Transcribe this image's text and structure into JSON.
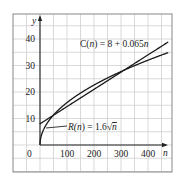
{
  "chart_data": {
    "type": "line",
    "title": "",
    "xlabel": "n",
    "ylabel": "y",
    "xlim": [
      -100,
      500
    ],
    "ylim": [
      -10,
      50
    ],
    "grid": true,
    "grid_step": {
      "x": 50,
      "y": 5
    },
    "x_ticks": [
      "0",
      "100",
      "200",
      "300",
      "400"
    ],
    "y_ticks": [
      "10",
      "20",
      "30",
      "40"
    ],
    "series": [
      {
        "name": "C(n) = 8 + 0.065n",
        "formula": "8 + 0.065n",
        "x": [
          0,
          100,
          200,
          300,
          400,
          460
        ],
        "values": [
          8,
          14.5,
          21,
          27.5,
          34,
          37.9
        ]
      },
      {
        "name": "R(n) = 1.6√n",
        "formula": "1.6*sqrt(n)",
        "x": [
          0,
          25,
          100,
          200,
          300,
          400,
          460
        ],
        "values": [
          0,
          8,
          16,
          22.6,
          27.7,
          32,
          34.3
        ]
      }
    ],
    "annotations": [
      {
        "text": "C(n) = 8 + 0.065n",
        "near_series": "C(n)"
      },
      {
        "text": "R(n) = 1.6√n",
        "near_series": "R(n)"
      }
    ],
    "intersections_approx": [
      {
        "n": 38,
        "y": 10.5
      },
      {
        "n": 384,
        "y": 33
      }
    ]
  },
  "labels": {
    "y_axis": "y",
    "x_axis": "n",
    "origin": "0",
    "c_label_prefix": "C(",
    "c_label_var": "n",
    "c_label_suffix": ") = 8 + 0.065",
    "c_label_tail": "n",
    "r_label_prefix": "R(",
    "r_label_var": "n",
    "r_label_mid": ") = 1.6",
    "r_label_root": "√",
    "r_label_tail": "n"
  }
}
